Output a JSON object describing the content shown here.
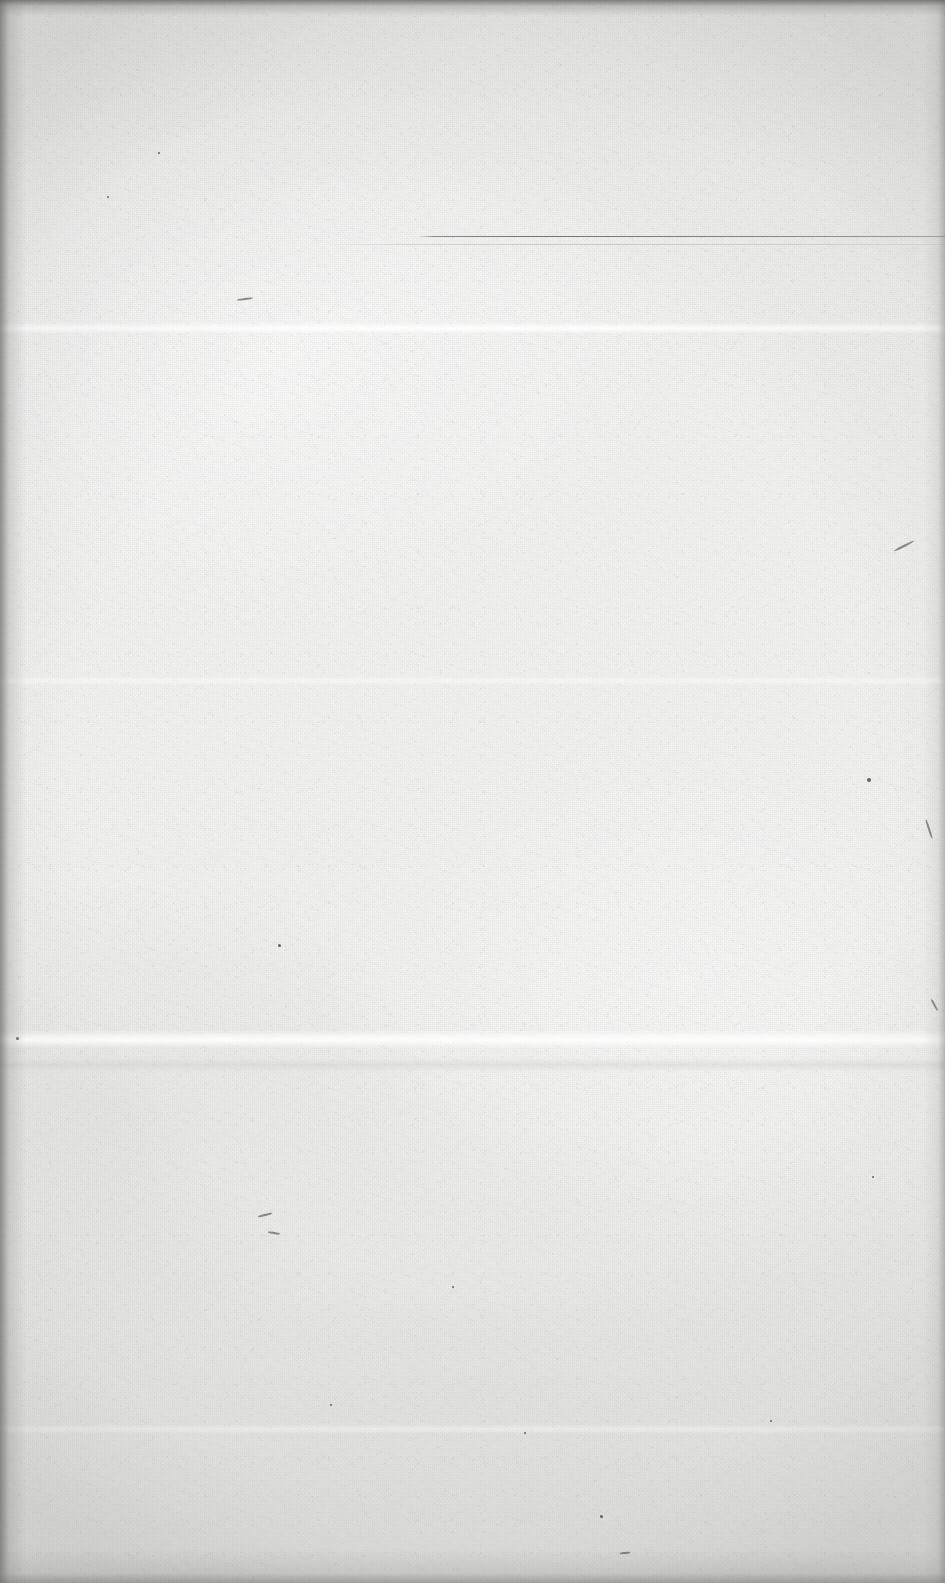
{
  "document": {
    "kind": "scanned-page",
    "page_state": "blank",
    "visible_text": "",
    "width_px": 945,
    "height_px": 1583,
    "paper": {
      "base_color": "#f2f2f1",
      "highlight_color": "#fafafa",
      "shadow_color": "#e2e2e0",
      "texture": "fibrous-laid-paper-grain"
    },
    "marks": {
      "rules": [
        {
          "name": "header-rule",
          "color": "#6c6c6a",
          "x_start": 418,
          "x_end": 945,
          "y": 236,
          "thickness_px": 1
        },
        {
          "name": "header-rule-ghost",
          "color": "#aaaaa8",
          "x_start": 330,
          "x_end": 945,
          "y": 244,
          "thickness_px": 1
        }
      ],
      "creases": [
        {
          "name": "crease-upper",
          "y": 322,
          "height_px": 12,
          "style": "bright"
        },
        {
          "name": "crease-mid",
          "y": 1030,
          "height_px": 18,
          "style": "bright"
        },
        {
          "name": "crease-mid-shadow",
          "y": 1058,
          "height_px": 14,
          "style": "shade"
        },
        {
          "name": "crease-lower",
          "y": 1424,
          "height_px": 10,
          "style": "soft"
        },
        {
          "name": "crease-upper-faint",
          "y": 676,
          "height_px": 10,
          "style": "soft"
        }
      ],
      "specks": [
        {
          "x": 158,
          "y": 152,
          "size": 2
        },
        {
          "x": 107,
          "y": 196,
          "size": 2
        },
        {
          "x": 278,
          "y": 944,
          "size": 3
        },
        {
          "x": 867,
          "y": 778,
          "size": 4
        },
        {
          "x": 16,
          "y": 1037,
          "size": 3
        },
        {
          "x": 600,
          "y": 1515,
          "size": 3
        },
        {
          "x": 872,
          "y": 1176,
          "size": 2
        },
        {
          "x": 452,
          "y": 1286,
          "size": 2
        },
        {
          "x": 330,
          "y": 1404,
          "size": 2
        },
        {
          "x": 770,
          "y": 1420,
          "size": 2
        },
        {
          "x": 524,
          "y": 1432,
          "size": 2
        }
      ],
      "fibers": [
        {
          "x": 237,
          "y": 298,
          "length": 16,
          "angle": -8
        },
        {
          "x": 893,
          "y": 545,
          "length": 22,
          "angle": -27
        },
        {
          "x": 919,
          "y": 828,
          "length": 20,
          "angle": 72
        },
        {
          "x": 258,
          "y": 1214,
          "length": 14,
          "angle": -14
        },
        {
          "x": 268,
          "y": 1232,
          "length": 12,
          "angle": 10
        },
        {
          "x": 928,
          "y": 1004,
          "length": 13,
          "angle": 60
        },
        {
          "x": 620,
          "y": 1552,
          "length": 10,
          "angle": -5
        }
      ]
    }
  }
}
